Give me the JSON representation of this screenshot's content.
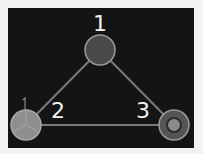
{
  "diagram": {
    "type": "graph",
    "background": "#141414",
    "nodes": [
      {
        "id": "1",
        "label": "1",
        "x": 100,
        "y": 50,
        "r": 15,
        "fill": "#4a4a4a",
        "stroke": "#9a9a9a"
      },
      {
        "id": "2",
        "label": "2",
        "x": 26,
        "y": 125,
        "r": 15,
        "fill": "#8f8f8f",
        "stroke": "#a8a8a8"
      },
      {
        "id": "3",
        "label": "3",
        "x": 174,
        "y": 125,
        "r": 15,
        "fill": "#555555",
        "stroke": "#9a9a9a",
        "inner_fill": "#8a8a8a"
      }
    ],
    "edges": [
      {
        "from": "1",
        "to": "2"
      },
      {
        "from": "1",
        "to": "3"
      },
      {
        "from": "2",
        "to": "3"
      }
    ],
    "edge_color": "#7a7a7a",
    "marker_2": "1"
  }
}
